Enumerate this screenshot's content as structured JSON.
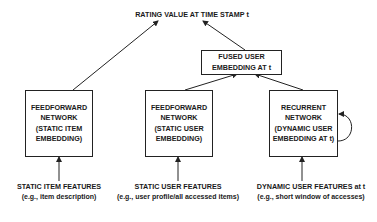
{
  "diagram": {
    "output": {
      "label": "RATING VALUE AT TIME STAMP t"
    },
    "fused": {
      "lines": [
        "FUSED USER",
        "EMBEDDING AT t"
      ]
    },
    "nodes": [
      {
        "id": "item-net",
        "lines": [
          "FEEDFORWARD",
          "NETWORK",
          "(STATIC ITEM",
          "EMBEDDING)"
        ]
      },
      {
        "id": "static-user-net",
        "lines": [
          "FEEDFORWARD",
          "NETWORK",
          "(STATIC USER",
          "EMBEDDING)"
        ]
      },
      {
        "id": "dynamic-user-net",
        "lines": [
          "RECURRENT",
          "NETWORK",
          "(DYNAMIC USER",
          "EMBEDDING AT t)"
        ]
      }
    ],
    "inputs": [
      {
        "title": "STATIC ITEM FEATURES",
        "subtitle": "(e.g., item description)"
      },
      {
        "title": "STATIC USER FEATURES",
        "subtitle": "(e.g., user profile/all accessed items)"
      },
      {
        "title": "DYNAMIC USER FEATURES at t",
        "subtitle": "(e.g., short window of accesses)"
      }
    ],
    "edges": [
      {
        "from": "STATIC ITEM FEATURES",
        "to": "item-net"
      },
      {
        "from": "STATIC USER FEATURES",
        "to": "static-user-net"
      },
      {
        "from": "DYNAMIC USER FEATURES at t",
        "to": "dynamic-user-net"
      },
      {
        "from": "item-net",
        "to": "RATING VALUE AT TIME STAMP t"
      },
      {
        "from": "static-user-net",
        "to": "FUSED USER EMBEDDING AT t"
      },
      {
        "from": "dynamic-user-net",
        "to": "FUSED USER EMBEDDING AT t"
      },
      {
        "from": "FUSED USER EMBEDDING AT t",
        "to": "RATING VALUE AT TIME STAMP t"
      },
      {
        "from": "dynamic-user-net",
        "to": "dynamic-user-net",
        "type": "self-loop"
      }
    ],
    "colors": {
      "stroke": "#222222",
      "text": "#1a1a1a",
      "background": "#ffffff"
    }
  }
}
